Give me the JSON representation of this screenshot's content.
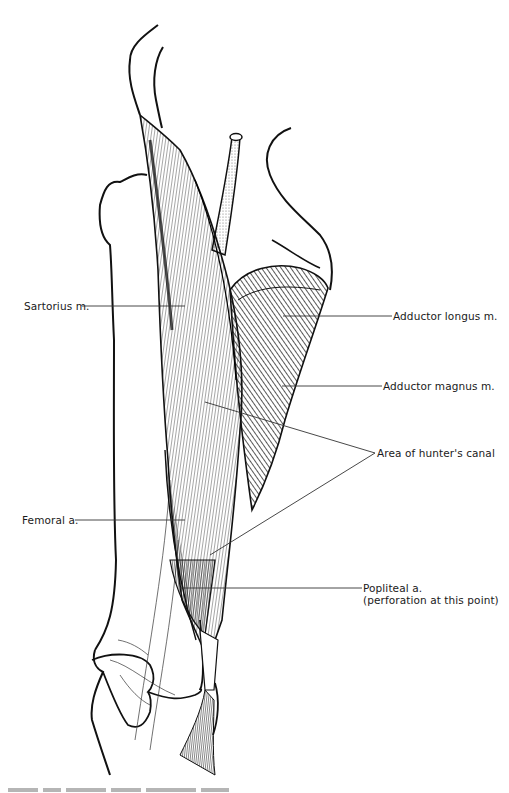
{
  "figure": {
    "labels": {
      "sartorius": "Sartorius m.",
      "adductor_longus": "Adductor longus m.",
      "adductor_magnus": "Adductor magnus m.",
      "hunters_canal": "Area of hunter's canal",
      "femoral": "Femoral a.",
      "popliteal_line1": "Popliteal a.",
      "popliteal_line2": "(perforation at this point)"
    },
    "caption_visible": "partially cropped, illegible",
    "colors": {
      "ink": "#111111",
      "leader": "#444444",
      "background": "#ffffff"
    }
  }
}
